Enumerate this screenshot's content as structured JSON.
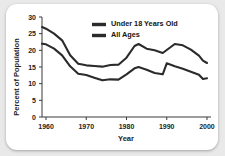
{
  "chart_data": {
    "type": "line",
    "title": "",
    "xlabel": "Year",
    "ylabel": "Percent of Population",
    "xlim": [
      1959,
      2001
    ],
    "ylim": [
      0,
      30
    ],
    "xticks": [
      "1960",
      "1970",
      "1980",
      "1990",
      "2000"
    ],
    "xtick_values": [
      1960,
      1970,
      1980,
      1990,
      2000
    ],
    "yticks": [
      "0",
      "5",
      "10",
      "15",
      "20",
      "25",
      "30"
    ],
    "ytick_values": [
      0,
      5,
      10,
      15,
      20,
      25,
      30
    ],
    "grid": false,
    "legend_position": "top-center",
    "x": [
      1959,
      1960,
      1962,
      1964,
      1966,
      1968,
      1970,
      1972,
      1974,
      1976,
      1978,
      1980,
      1982,
      1983,
      1985,
      1987,
      1989,
      1990,
      1992,
      1994,
      1996,
      1998,
      1999,
      2000
    ],
    "series": [
      {
        "name": "Under 18 Years Old",
        "color": "#2b2b2b",
        "values": [
          27.0,
          26.5,
          25.0,
          23.0,
          18.5,
          16.0,
          15.5,
          15.3,
          15.1,
          15.6,
          15.7,
          17.8,
          21.3,
          21.9,
          20.5,
          20.0,
          19.2,
          20.1,
          21.9,
          21.5,
          20.2,
          18.4,
          16.9,
          16.2
        ]
      },
      {
        "name": "All Ages",
        "color": "#2b2b2b",
        "values": [
          22.0,
          21.8,
          20.5,
          18.5,
          15.2,
          13.0,
          12.6,
          11.8,
          11.0,
          11.3,
          11.2,
          12.8,
          14.6,
          15.0,
          14.2,
          13.2,
          12.8,
          16.1,
          15.2,
          14.5,
          13.6,
          12.7,
          11.4,
          11.6
        ]
      }
    ],
    "legend": [
      {
        "label": "Under 18 Years Old",
        "color": "#2b2b2b"
      },
      {
        "label": "All Ages",
        "color": "#2b2b2b"
      }
    ]
  }
}
